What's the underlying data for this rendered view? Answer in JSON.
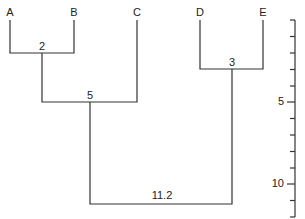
{
  "diagram": {
    "type": "dendrogram",
    "leaves": [
      {
        "id": "A",
        "label": "A",
        "x": 10
      },
      {
        "id": "B",
        "label": "B",
        "x": 74
      },
      {
        "id": "C",
        "label": "C",
        "x": 137
      },
      {
        "id": "D",
        "label": "D",
        "x": 200
      },
      {
        "id": "E",
        "label": "E",
        "x": 263
      }
    ],
    "merges": [
      {
        "children": [
          "A",
          "B"
        ],
        "height": 2,
        "label": "2"
      },
      {
        "children": [
          "D",
          "E"
        ],
        "height": 3,
        "label": "3"
      },
      {
        "children": [
          "AB",
          "C"
        ],
        "height": 5,
        "label": "5"
      },
      {
        "children": [
          "ABC",
          "DE"
        ],
        "height": 11.2,
        "label": "11.2"
      }
    ],
    "scale": {
      "min": 0,
      "max": 12,
      "minor_tick_step": 1,
      "tick_labels": [
        {
          "value": 5,
          "label": "5"
        },
        {
          "value": 10,
          "label": "10"
        }
      ]
    },
    "line_color": "#333333"
  }
}
